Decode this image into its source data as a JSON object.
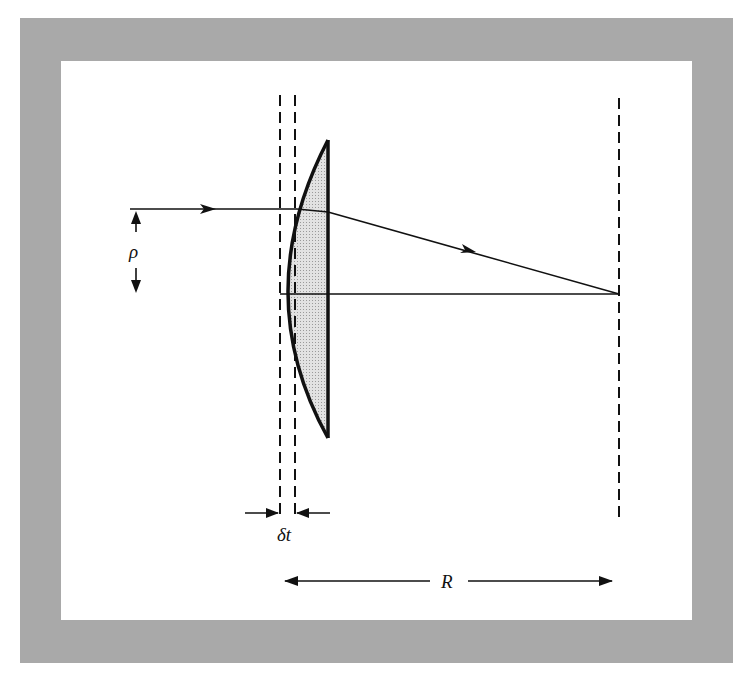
{
  "figure": {
    "type": "lens-ray-diagram",
    "colors": {
      "frame": "#a9a9a9",
      "background": "#ffffff",
      "lens_fill": "#d4d4d4",
      "ink": "#111111"
    }
  },
  "labels": {
    "rho": "ρ",
    "delta_t": "δt",
    "R": "R"
  }
}
